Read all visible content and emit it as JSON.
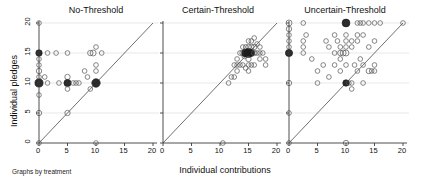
{
  "figure": {
    "ylabel": "Individual pledges",
    "xlabel": "Individual contributions",
    "footnote": "Graphs by treatment"
  },
  "chart_data": {
    "type": "scatter",
    "title": "",
    "xlabel": "Individual contributions",
    "ylabel": "Individual pledges",
    "xlim": [
      0,
      20
    ],
    "ylim": [
      0,
      20
    ],
    "xticks": [
      0,
      5,
      10,
      15,
      20
    ],
    "yticks": [
      0,
      5,
      10,
      15,
      20
    ],
    "grid": "horizontal",
    "grid_values": [
      5,
      10,
      15,
      20
    ],
    "legend": "none",
    "reference_line": {
      "type": "45-degree",
      "from": [
        0,
        0
      ],
      "to": [
        20,
        20
      ]
    },
    "marker": "open-circle",
    "marker_size_encodes": "frequency",
    "panels": [
      {
        "label": "No-Threshold",
        "xticklabels": [
          "0",
          "5",
          "10",
          "15",
          "20"
        ],
        "points": [
          {
            "x": 0,
            "y": 20,
            "w": 1
          },
          {
            "x": 0,
            "y": 15,
            "w": 4
          },
          {
            "x": 0,
            "y": 14,
            "w": 1
          },
          {
            "x": 0,
            "y": 13,
            "w": 1
          },
          {
            "x": 0,
            "y": 12,
            "w": 2
          },
          {
            "x": 0,
            "y": 11,
            "w": 1
          },
          {
            "x": 0,
            "y": 10,
            "w": 9
          },
          {
            "x": 0,
            "y": 8,
            "w": 1
          },
          {
            "x": 0,
            "y": 5,
            "w": 2
          },
          {
            "x": 0,
            "y": 0,
            "w": 1
          },
          {
            "x": 1.5,
            "y": 15,
            "w": 1
          },
          {
            "x": 1,
            "y": 11,
            "w": 1
          },
          {
            "x": 1.5,
            "y": 10,
            "w": 1
          },
          {
            "x": 3,
            "y": 15,
            "w": 1
          },
          {
            "x": 3.5,
            "y": 10,
            "w": 1
          },
          {
            "x": 5,
            "y": 15,
            "w": 1
          },
          {
            "x": 5,
            "y": 11,
            "w": 2
          },
          {
            "x": 5,
            "y": 10,
            "w": 6
          },
          {
            "x": 5,
            "y": 9,
            "w": 1
          },
          {
            "x": 5,
            "y": 5,
            "w": 2
          },
          {
            "x": 6,
            "y": 10,
            "w": 1
          },
          {
            "x": 6.5,
            "y": 10,
            "w": 1
          },
          {
            "x": 7,
            "y": 10,
            "w": 1
          },
          {
            "x": 8,
            "y": 12,
            "w": 1
          },
          {
            "x": 8.5,
            "y": 11,
            "w": 1
          },
          {
            "x": 9,
            "y": 15,
            "w": 2
          },
          {
            "x": 9,
            "y": 9,
            "w": 1
          },
          {
            "x": 9.5,
            "y": 15,
            "w": 3
          },
          {
            "x": 10,
            "y": 16,
            "w": 1
          },
          {
            "x": 10,
            "y": 13,
            "w": 1
          },
          {
            "x": 10,
            "y": 12,
            "w": 1
          },
          {
            "x": 10,
            "y": 10,
            "w": 10
          },
          {
            "x": 10,
            "y": 0,
            "w": 1
          },
          {
            "x": 11,
            "y": 15,
            "w": 1
          }
        ]
      },
      {
        "label": "Certain-Threshold",
        "xticklabels": [
          "0",
          "5",
          "10",
          "15",
          "20"
        ],
        "points": [
          {
            "x": 10.5,
            "y": 0,
            "w": 1
          },
          {
            "x": 11.5,
            "y": 10,
            "w": 1
          },
          {
            "x": 12,
            "y": 11,
            "w": 1
          },
          {
            "x": 12.5,
            "y": 13,
            "w": 1
          },
          {
            "x": 12.5,
            "y": 11,
            "w": 1
          },
          {
            "x": 13,
            "y": 14,
            "w": 1
          },
          {
            "x": 13,
            "y": 13,
            "w": 1
          },
          {
            "x": 13,
            "y": 12,
            "w": 1
          },
          {
            "x": 13.5,
            "y": 15,
            "w": 1
          },
          {
            "x": 13.5,
            "y": 13,
            "w": 1
          },
          {
            "x": 14,
            "y": 16,
            "w": 1
          },
          {
            "x": 14,
            "y": 15,
            "w": 3
          },
          {
            "x": 14,
            "y": 13,
            "w": 1
          },
          {
            "x": 14.3,
            "y": 14.5,
            "w": 2
          },
          {
            "x": 14.5,
            "y": 15,
            "w": 8
          },
          {
            "x": 14.5,
            "y": 16,
            "w": 1
          },
          {
            "x": 14.5,
            "y": 12.5,
            "w": 1
          },
          {
            "x": 15,
            "y": 17,
            "w": 1
          },
          {
            "x": 15,
            "y": 16,
            "w": 2
          },
          {
            "x": 15,
            "y": 15,
            "w": 12
          },
          {
            "x": 15,
            "y": 14,
            "w": 2
          },
          {
            "x": 15,
            "y": 13,
            "w": 1
          },
          {
            "x": 15,
            "y": 12,
            "w": 1
          },
          {
            "x": 15.5,
            "y": 17,
            "w": 1
          },
          {
            "x": 15.5,
            "y": 16,
            "w": 2
          },
          {
            "x": 15.5,
            "y": 15,
            "w": 5
          },
          {
            "x": 15.5,
            "y": 13,
            "w": 1
          },
          {
            "x": 16,
            "y": 17.5,
            "w": 1
          },
          {
            "x": 16,
            "y": 16,
            "w": 2
          },
          {
            "x": 16,
            "y": 15,
            "w": 2
          },
          {
            "x": 16,
            "y": 13,
            "w": 1
          },
          {
            "x": 16.5,
            "y": 16.5,
            "w": 1
          },
          {
            "x": 16.5,
            "y": 15,
            "w": 1
          },
          {
            "x": 17,
            "y": 16,
            "w": 1
          },
          {
            "x": 17,
            "y": 15,
            "w": 1
          },
          {
            "x": 17,
            "y": 14,
            "w": 1
          },
          {
            "x": 17.5,
            "y": 15,
            "w": 1
          },
          {
            "x": 18,
            "y": 14,
            "w": 1
          },
          {
            "x": 18,
            "y": 13,
            "w": 1
          }
        ]
      },
      {
        "label": "Uncertain-Threshold",
        "xticklabels": [
          "0",
          "5",
          "10",
          "15",
          "20"
        ],
        "points": [
          {
            "x": 0,
            "y": 20,
            "w": 3
          },
          {
            "x": 0,
            "y": 19,
            "w": 2
          },
          {
            "x": 0,
            "y": 18,
            "w": 1
          },
          {
            "x": 0,
            "y": 17,
            "w": 1
          },
          {
            "x": 0,
            "y": 16,
            "w": 1
          },
          {
            "x": 0,
            "y": 15,
            "w": 6
          },
          {
            "x": 0,
            "y": 10,
            "w": 2
          },
          {
            "x": 0,
            "y": 5,
            "w": 1
          },
          {
            "x": 0,
            "y": 0,
            "w": 1
          },
          {
            "x": 2.5,
            "y": 20,
            "w": 1
          },
          {
            "x": 2.5,
            "y": 17,
            "w": 1
          },
          {
            "x": 2.5,
            "y": 16,
            "w": 1
          },
          {
            "x": 2.5,
            "y": 15,
            "w": 1
          },
          {
            "x": 3,
            "y": 18,
            "w": 1
          },
          {
            "x": 4,
            "y": 14,
            "w": 1
          },
          {
            "x": 5,
            "y": 10,
            "w": 1
          },
          {
            "x": 5,
            "y": 12,
            "w": 1
          },
          {
            "x": 6,
            "y": 13,
            "w": 1
          },
          {
            "x": 6.5,
            "y": 17,
            "w": 1
          },
          {
            "x": 7,
            "y": 16,
            "w": 1
          },
          {
            "x": 7,
            "y": 11,
            "w": 1
          },
          {
            "x": 8,
            "y": 18,
            "w": 1
          },
          {
            "x": 8,
            "y": 15,
            "w": 1
          },
          {
            "x": 8,
            "y": 13,
            "w": 1
          },
          {
            "x": 8.5,
            "y": 17,
            "w": 1
          },
          {
            "x": 9,
            "y": 16,
            "w": 1
          },
          {
            "x": 9,
            "y": 15,
            "w": 2
          },
          {
            "x": 9,
            "y": 14,
            "w": 1
          },
          {
            "x": 9,
            "y": 12,
            "w": 1
          },
          {
            "x": 9.5,
            "y": 15,
            "w": 3
          },
          {
            "x": 10,
            "y": 20,
            "w": 8
          },
          {
            "x": 10,
            "y": 18,
            "w": 1
          },
          {
            "x": 10,
            "y": 17,
            "w": 1
          },
          {
            "x": 10,
            "y": 16,
            "w": 1
          },
          {
            "x": 10,
            "y": 15,
            "w": 3
          },
          {
            "x": 10,
            "y": 13,
            "w": 1
          },
          {
            "x": 10,
            "y": 10,
            "w": 4
          },
          {
            "x": 10,
            "y": 0,
            "w": 2
          },
          {
            "x": 10.5,
            "y": 10,
            "w": 1
          },
          {
            "x": 11,
            "y": 17,
            "w": 1
          },
          {
            "x": 11,
            "y": 16,
            "w": 1
          },
          {
            "x": 11,
            "y": 10,
            "w": 1
          },
          {
            "x": 11,
            "y": 9,
            "w": 1
          },
          {
            "x": 11.5,
            "y": 13,
            "w": 1
          },
          {
            "x": 12,
            "y": 20,
            "w": 1
          },
          {
            "x": 12,
            "y": 18,
            "w": 1
          },
          {
            "x": 12,
            "y": 17,
            "w": 1
          },
          {
            "x": 12,
            "y": 12,
            "w": 1
          },
          {
            "x": 12.5,
            "y": 20,
            "w": 1
          },
          {
            "x": 12.5,
            "y": 14,
            "w": 1
          },
          {
            "x": 13,
            "y": 20,
            "w": 1
          },
          {
            "x": 13,
            "y": 18,
            "w": 1
          },
          {
            "x": 13,
            "y": 13,
            "w": 1
          },
          {
            "x": 13,
            "y": 10,
            "w": 1
          },
          {
            "x": 14,
            "y": 20,
            "w": 1
          },
          {
            "x": 14,
            "y": 16,
            "w": 1
          },
          {
            "x": 14,
            "y": 12,
            "w": 2
          },
          {
            "x": 14.5,
            "y": 12,
            "w": 1
          },
          {
            "x": 15,
            "y": 20,
            "w": 1
          },
          {
            "x": 15,
            "y": 17,
            "w": 1
          },
          {
            "x": 15,
            "y": 13,
            "w": 1
          },
          {
            "x": 15,
            "y": 12,
            "w": 1
          },
          {
            "x": 16,
            "y": 20,
            "w": 1
          },
          {
            "x": 20,
            "y": 20,
            "w": 1
          }
        ]
      }
    ]
  },
  "style": {
    "axis_color": "#3a3a3a",
    "grid_color": "#d8d8d8",
    "marker_stroke": "#555555",
    "marker_dark": "#1b1b1b",
    "diag_color": "#4a4a4a"
  }
}
